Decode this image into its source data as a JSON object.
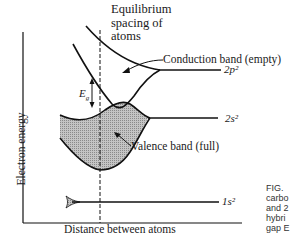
{
  "diagram": {
    "type": "energy-band-diagram",
    "y_axis_label": "Electron energy",
    "x_axis_label": "Distance between atoms",
    "equilibrium_label": [
      "Equilibrium",
      "spacing of",
      "atoms"
    ],
    "band_gap_label": "E",
    "band_gap_subscript": "g",
    "conduction_band_label": "Conduction band (empty)",
    "valence_band_label": "Valence band (full)",
    "orbitals": {
      "upper": "2p²",
      "middle": "2s²",
      "lower": "1s²"
    },
    "caption_fragment": "FIG.\ncarbo\nand 2\nhybri\ngap E",
    "colors": {
      "line": "#111111",
      "band_fill": "#b8b8b8",
      "background": "#ffffff"
    }
  }
}
